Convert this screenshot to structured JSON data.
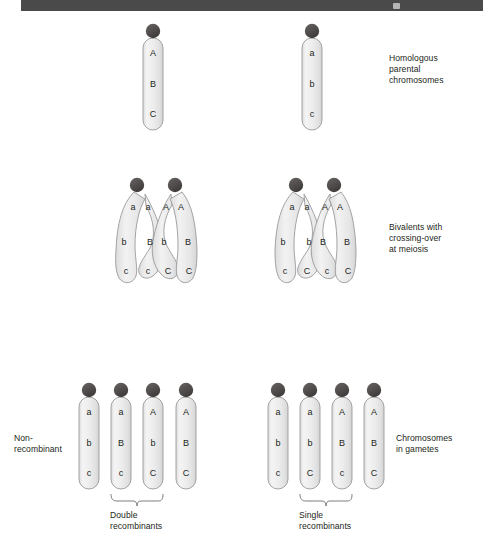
{
  "figure": {
    "title_bar": {
      "present": true,
      "color": "#4a4a4a"
    },
    "background": "#ffffff",
    "chromosome_fill_top": "#f2f2f2",
    "chromosome_fill_bottom": "#e2e2e2",
    "chromosome_stroke": "#8c8c8c",
    "centromere_color": "#4d4d4d",
    "text_color": "#231f20"
  },
  "annotations": {
    "homologous": "Homologous\nparental\nchromosomes",
    "bivalents": "Bivalents with\ncrossing-over\nat meiosis",
    "gametes": "Chromosomes\nin gametes",
    "non_recombinant": "Non-\nrecombinant",
    "double_recombinants": "Double\nrecombinants",
    "single_recombinants": "Single\nrecombinants"
  },
  "rows": {
    "parental": {
      "label": "Homologous parental chromosomes",
      "chromosomes": [
        {
          "id": "parent-left",
          "cx": 153,
          "alleles": [
            "A",
            "B",
            "C"
          ]
        },
        {
          "id": "parent-right",
          "cx": 312,
          "alleles": [
            "a",
            "b",
            "c"
          ]
        }
      ]
    },
    "bivalent_left": {
      "label": "Bivalent with double crossing-over",
      "centromeres": [
        {
          "cx": 137
        },
        {
          "cx": 175
        }
      ],
      "chromatid_labels": {
        "top": [
          "a",
          "a",
          "A",
          "A"
        ],
        "middle": [
          "b",
          "B",
          "b",
          "B"
        ],
        "bottom": [
          "c",
          "c",
          "C",
          "C"
        ]
      }
    },
    "bivalent_right": {
      "label": "Bivalent with single crossing-over",
      "centromeres": [
        {
          "cx": 296
        },
        {
          "cx": 334
        }
      ],
      "chromatid_labels": {
        "top": [
          "a",
          "a",
          "A",
          "A"
        ],
        "middle": [
          "b",
          "b",
          "B",
          "B"
        ],
        "bottom": [
          "c",
          "C",
          "c",
          "C"
        ]
      }
    },
    "gametes_left": {
      "label": "Gametes from double crossing-over",
      "chromosomes": [
        {
          "id": "gamete-l1",
          "cx": 89,
          "alleles": [
            "a",
            "b",
            "c"
          ],
          "class": "non-recombinant"
        },
        {
          "id": "gamete-l2",
          "cx": 121,
          "alleles": [
            "a",
            "B",
            "c"
          ],
          "class": "double-recombinant"
        },
        {
          "id": "gamete-l3",
          "cx": 153,
          "alleles": [
            "A",
            "b",
            "C"
          ],
          "class": "double-recombinant"
        },
        {
          "id": "gamete-l4",
          "cx": 186,
          "alleles": [
            "A",
            "B",
            "C"
          ],
          "class": "non-recombinant"
        }
      ],
      "bracket": {
        "from": 121,
        "to": 153,
        "label": "Double\nrecombinants"
      }
    },
    "gametes_right": {
      "label": "Gametes from single crossing-over",
      "chromosomes": [
        {
          "id": "gamete-r1",
          "cx": 278,
          "alleles": [
            "a",
            "b",
            "c"
          ],
          "class": "non-recombinant"
        },
        {
          "id": "gamete-r2",
          "cx": 310,
          "alleles": [
            "a",
            "b",
            "C"
          ],
          "class": "single-recombinant"
        },
        {
          "id": "gamete-r3",
          "cx": 342,
          "alleles": [
            "A",
            "B",
            "c"
          ],
          "class": "single-recombinant"
        },
        {
          "id": "gamete-r4",
          "cx": 374,
          "alleles": [
            "A",
            "B",
            "C"
          ],
          "class": "non-recombinant"
        }
      ],
      "bracket": {
        "from": 310,
        "to": 342,
        "label": "Single\nrecombinants"
      }
    }
  }
}
